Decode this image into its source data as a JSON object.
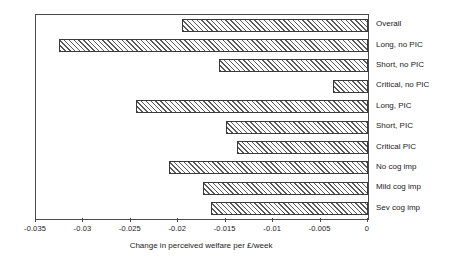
{
  "chart_data": {
    "type": "bar",
    "orientation": "horizontal",
    "title": "",
    "xlabel": "Change in perceived welfare per £/week",
    "ylabel": "",
    "xlim": [
      -0.035,
      0
    ],
    "xticks": [
      "-0.035",
      "-0.03",
      "-0.025",
      "-0.02",
      "-0.015",
      "-0.01",
      "-0.005",
      "0"
    ],
    "xtick_values": [
      -0.035,
      -0.03,
      -0.025,
      -0.02,
      -0.015,
      -0.01,
      -0.005,
      0
    ],
    "grid": false,
    "legend": "none",
    "bar_fill": "diagonal-hatch",
    "categories": [
      "Overall",
      "Long, no PIC",
      "Short, no PIC",
      "Critical, no PIC",
      "Long, PIC",
      "Short, PIC",
      "Critical PIC",
      "No cog imp",
      "Mild cog imp",
      "Sev cog imp"
    ],
    "values": [
      -0.0196,
      -0.0326,
      -0.0157,
      -0.0037,
      -0.0245,
      -0.015,
      -0.0138,
      -0.021,
      -0.0174,
      -0.0166
    ]
  },
  "colors": {
    "frame": "#4a4a4a",
    "hatch": "#5a5a5a",
    "bar_edge": "#3a3a3a",
    "text": "#1a1a1a",
    "background": "#ffffff"
  }
}
